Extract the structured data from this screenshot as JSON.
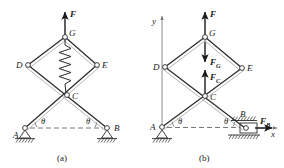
{
  "figure": {
    "kind": "engineering-free-body-diagram",
    "captions": {
      "left": "(a)",
      "right": "(b)"
    }
  },
  "diagram_a": {
    "caption": "(a)",
    "joints": [
      {
        "id": "G",
        "label": "G",
        "x": 65,
        "y": 37
      },
      {
        "id": "D",
        "label": "D",
        "x": 28,
        "y": 65
      },
      {
        "id": "E",
        "label": "E",
        "x": 97,
        "y": 65
      },
      {
        "id": "C",
        "label": "C",
        "x": 67,
        "y": 95
      },
      {
        "id": "A",
        "label": "A",
        "x": 25,
        "y": 128
      },
      {
        "id": "B",
        "label": "B",
        "x": 107,
        "y": 128
      }
    ],
    "forces": [
      {
        "id": "F",
        "label": "F",
        "subscript": "",
        "direction": "up",
        "at": "G"
      }
    ],
    "angles": [
      {
        "label": "θ",
        "at": "A"
      },
      {
        "label": "θ",
        "at": "B"
      }
    ],
    "spring": {
      "from": "G",
      "to": "C",
      "label": ""
    },
    "supports": [
      {
        "at": "A",
        "type": "pin-hatched-ground"
      },
      {
        "at": "B",
        "type": "pin-hatched-ground"
      }
    ],
    "baseline": {
      "type": "dashed-horizontal",
      "from": "A",
      "to": "B"
    }
  },
  "diagram_b": {
    "caption": "(b)",
    "joints": [
      {
        "id": "G",
        "label": "G",
        "x": 205,
        "y": 37
      },
      {
        "id": "D",
        "label": "D",
        "x": 165,
        "y": 67
      },
      {
        "id": "E",
        "label": "E",
        "x": 242,
        "y": 68
      },
      {
        "id": "C",
        "label": "C",
        "x": 205,
        "y": 96
      },
      {
        "id": "A",
        "label": "A",
        "x": 162,
        "y": 127
      },
      {
        "id": "B",
        "label": "B",
        "x": 245,
        "y": 128
      }
    ],
    "forces": [
      {
        "id": "F",
        "label": "F",
        "subscript": "",
        "direction": "up",
        "at": "G"
      },
      {
        "id": "FG",
        "label": "F",
        "subscript": "G",
        "direction": "down",
        "at": "G"
      },
      {
        "id": "FC",
        "label": "F",
        "subscript": "C",
        "direction": "up",
        "at": "C"
      },
      {
        "id": "FB",
        "label": "F",
        "subscript": "B",
        "direction": "right",
        "at": "B"
      }
    ],
    "axes": {
      "y": {
        "label": "y",
        "direction": "up"
      },
      "x": {
        "label": "x",
        "direction": "right"
      }
    },
    "angles": [
      {
        "label": "θ",
        "at": "A"
      },
      {
        "label": "θ",
        "at": "B"
      }
    ],
    "supports": [
      {
        "at": "A",
        "type": "pin-hatched-ground"
      },
      {
        "at": "B",
        "type": "slider-in-guide"
      }
    ],
    "baseline": {
      "type": "dashed-horizontal",
      "from": "A",
      "to": "B"
    }
  },
  "colors": {
    "ink": "#1a1a1a",
    "bar": "#2b2b2b",
    "guide": "#6e6e6e",
    "dash": "#555555",
    "paper": "#ffffff"
  }
}
